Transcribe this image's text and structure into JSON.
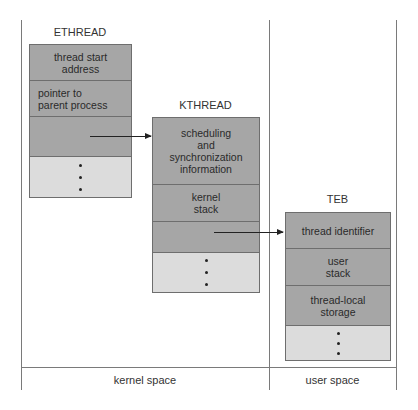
{
  "diagram": {
    "ethread": {
      "title": "ETHREAD",
      "fields": [
        "thread start\naddress",
        "pointer to\nparent process",
        "",
        "..."
      ]
    },
    "kthread": {
      "title": "KTHREAD",
      "fields": [
        "scheduling\nand\nsynchronization\ninformation",
        "kernel\nstack",
        "",
        "..."
      ]
    },
    "teb": {
      "title": "TEB",
      "fields": [
        "thread identifier",
        "user\nstack",
        "thread-local\nstorage",
        "..."
      ]
    },
    "regions": {
      "kernel": "kernel space",
      "user": "user space"
    },
    "arrows": [
      {
        "from": "ETHREAD",
        "to": "KTHREAD"
      },
      {
        "from": "KTHREAD",
        "to": "TEB"
      }
    ],
    "colors": {
      "field_dark": "#a6a6a6",
      "field_light": "#dcdcdc"
    }
  }
}
